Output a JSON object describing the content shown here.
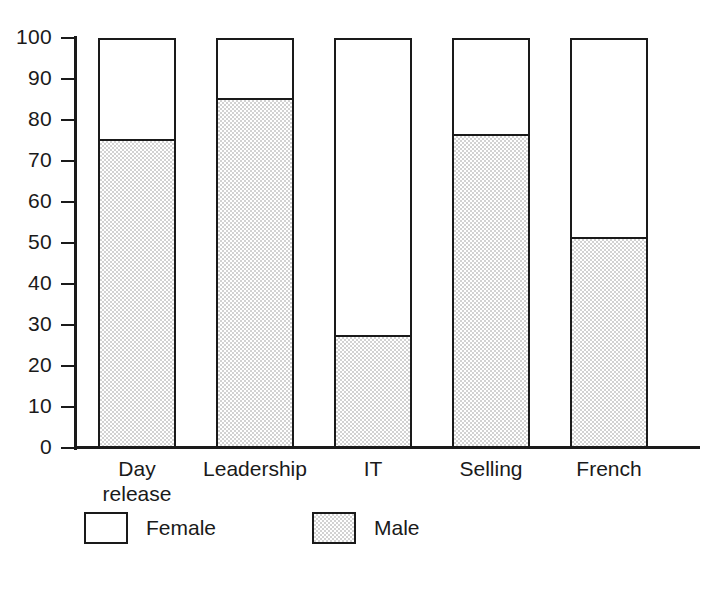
{
  "chart_data": {
    "type": "bar",
    "title": "",
    "subtitle": "",
    "xlabel": "",
    "ylabel": "",
    "stacked": true,
    "stack_total": 100,
    "grid": false,
    "legend_position": "bottom-left",
    "ylim": [
      0,
      100
    ],
    "ytick_step": 10,
    "yticks": [
      100,
      90,
      80,
      70,
      60,
      50,
      40,
      30,
      20,
      10,
      0
    ],
    "ytick_labels": [
      "100",
      "90",
      "80",
      "70",
      "60",
      "50",
      "40",
      "30",
      "20",
      "10",
      "0"
    ],
    "categories": [
      "Day release",
      "Leadership",
      "IT",
      "Selling",
      "French"
    ],
    "category_lines": [
      [
        "Day",
        "release"
      ],
      [
        "Leadership"
      ],
      [
        "IT"
      ],
      [
        "Selling"
      ],
      [
        "French"
      ]
    ],
    "series": [
      {
        "name": "Female",
        "fill": "white",
        "values": [
          25,
          15,
          73,
          24,
          49
        ]
      },
      {
        "name": "Male",
        "fill": "stipple",
        "values": [
          75,
          85,
          27,
          76,
          51
        ]
      }
    ],
    "annotations": []
  },
  "legend": {
    "items": [
      {
        "label": "Female",
        "swatch": "white-square"
      },
      {
        "label": "Male",
        "swatch": "stipple-square"
      }
    ]
  },
  "colors": {
    "ink": "#1a1a1a",
    "female_fill": "#ffffff",
    "male_fill": "#d2d2d2",
    "background": "#ffffff"
  }
}
